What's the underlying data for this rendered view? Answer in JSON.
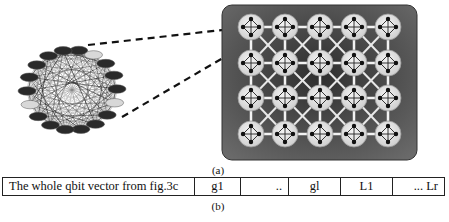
{
  "figure": {
    "caption_a": "(a)",
    "caption_b": "(b)",
    "left_graph": {
      "node_count": 18,
      "type": "fully-connected qubit graph"
    },
    "right_grid": {
      "rows": 4,
      "cols": 5,
      "type": "lattice of 4-qubit cells"
    },
    "colors": {
      "panel": "#4a4a4a",
      "node_fill": "#e6e6e6",
      "edge": "#ffffff",
      "dark": "#111111"
    }
  },
  "vector_table": {
    "cells": [
      {
        "label": "The whole qbit vector from fig.3c",
        "width": 192,
        "align": "left"
      },
      {
        "label": "g1",
        "width": 46,
        "align": "center"
      },
      {
        "label": "..",
        "width": 48,
        "align": "right"
      },
      {
        "label": "gl",
        "width": 52,
        "align": "center"
      },
      {
        "label": "L1",
        "width": 52,
        "align": "center"
      },
      {
        "label": "... Lr",
        "width": 51,
        "align": "right"
      }
    ]
  }
}
